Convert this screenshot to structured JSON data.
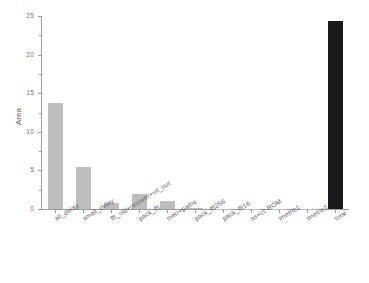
{
  "chart_data": {
    "type": "bar",
    "title": "",
    "xlabel": "",
    "ylabel": "Area",
    "ylim": [
      0,
      25
    ],
    "ytick_labels": [
      "0",
      "5",
      "10",
      "15",
      "20",
      "25"
    ],
    "ytick_values": [
      0,
      5,
      10,
      15,
      20,
      25
    ],
    "minor_ticks": true,
    "grid": false,
    "legend": null,
    "categories": [
      "all_delay",
      "small_delay",
      "fft_old+recover+vit_out",
      "pack_fft",
      "metr+paths",
      "pack_fft256",
      "pack_fft16",
      "ss+cc ROM",
      "lmetric1",
      "lmetric2",
      "total"
    ],
    "values": [
      13.7,
      5.5,
      0.8,
      2.0,
      1.1,
      0.15,
      0.03,
      0.02,
      0.02,
      0.02,
      24.3
    ],
    "bar_colors": [
      "#bdbdbd",
      "#bdbdbd",
      "#bdbdbd",
      "#bdbdbd",
      "#bdbdbd",
      "#bdbdbd",
      "#bdbdbd",
      "#bdbdbd",
      "#bdbdbd",
      "#bdbdbd",
      "#1a1a1a"
    ]
  },
  "colors": {
    "axis": "#9a9a9a",
    "bar_default": "#bdbdbd",
    "bar_highlight": "#1a1a1a",
    "text": "#5f5f5f",
    "background": "#ffffff"
  }
}
